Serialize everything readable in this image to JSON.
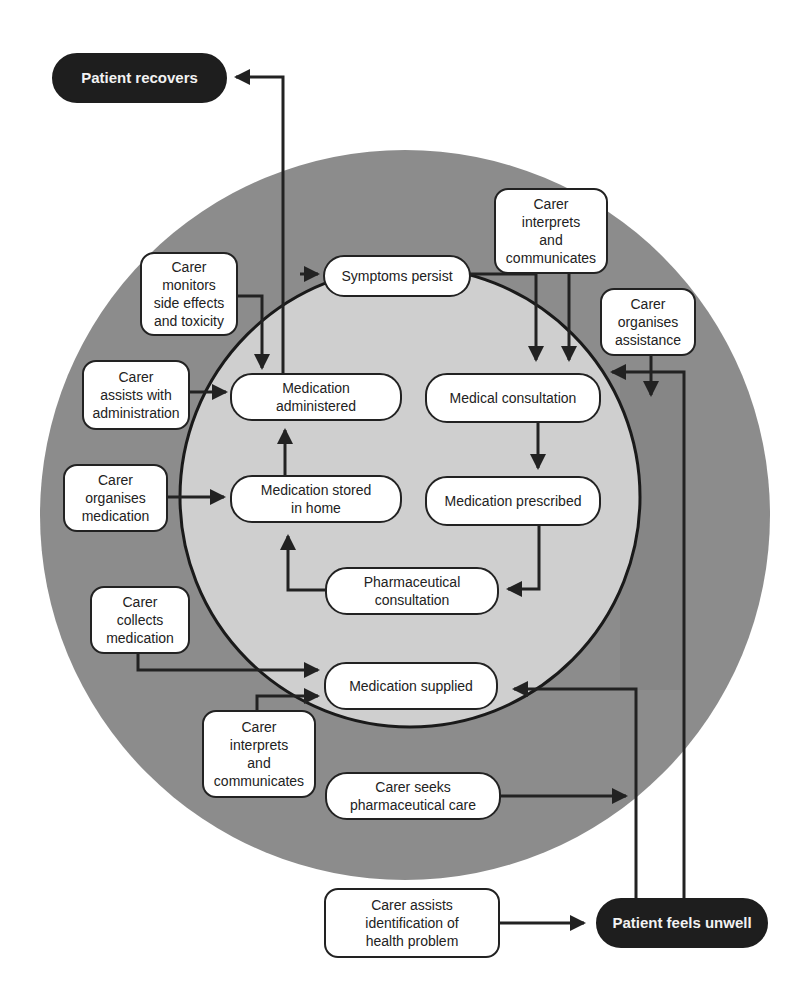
{
  "diagram": {
    "colors": {
      "outer_ring": "#8c8c8c",
      "inner_circle": "#cfcfcf",
      "box_fill": "#ffffff",
      "outcome_fill": "#1e1e1e",
      "line": "#222222"
    },
    "outcomes": {
      "recovers": "Patient recovers",
      "unwell": "Patient feels unwell"
    },
    "inner_process": {
      "symptoms_persist": "Symptoms persist",
      "medical_consultation": "Medical consultation",
      "medication_prescribed": "Medication prescribed",
      "pharmaceutical_consultation": "Pharmaceutical\nconsultation",
      "medication_supplied": "Medication supplied",
      "medication_stored": "Medication stored\nin home",
      "medication_administered": "Medication\nadministered"
    },
    "carer_roles": {
      "interprets_top": "Carer\ninterprets\nand\ncommunicates",
      "organises_assistance": "Carer\norganises\nassistance",
      "monitors": "Carer\nmonitors\nside effects\nand toxicity",
      "assists_administration": "Carer\nassists with\nadministration",
      "organises_medication": "Carer\norganises\nmedication",
      "collects_medication": "Carer\ncollects\nmedication",
      "interprets_bottom": "Carer\ninterprets\nand\ncommunicates",
      "seeks_pharma": "Carer seeks\npharmaceutical care",
      "assists_identification": "Carer assists\nidentification of\nhealth problem"
    }
  }
}
